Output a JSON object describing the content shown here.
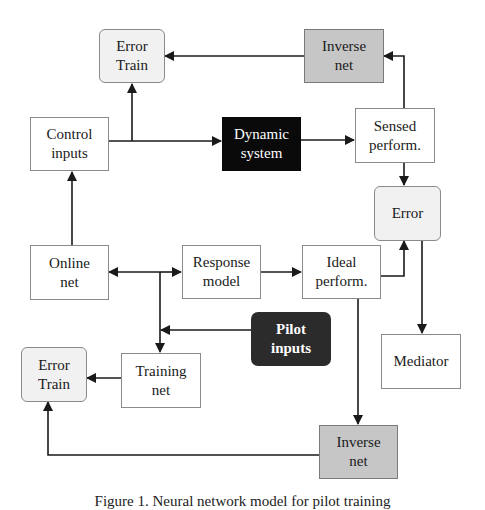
{
  "diagram": {
    "colors": {
      "plain_fill": "#ffffff",
      "rounded_fill": "#f1f1f1",
      "inverse_fill": "#c6c6c6",
      "dynamic_fill": "#0a0a0a",
      "pilot_fill": "#2b2b2b",
      "line": "#1a1a1a"
    },
    "nodes": {
      "error_train_top": {
        "label": "Error\nTrain",
        "style": "rounded"
      },
      "inverse_net_top": {
        "label": "Inverse\nnet",
        "style": "gray"
      },
      "control_inputs": {
        "label": "Control\ninputs",
        "style": "plain"
      },
      "dynamic_system": {
        "label": "Dynamic\nsystem",
        "style": "black"
      },
      "sensed_perform": {
        "label": "Sensed\nperform.",
        "style": "plain"
      },
      "error_right": {
        "label": "Error",
        "style": "rounded"
      },
      "online_net": {
        "label": "Online\nnet",
        "style": "plain"
      },
      "response_model": {
        "label": "Response\nmodel",
        "style": "plain"
      },
      "ideal_perform": {
        "label": "Ideal\nperform.",
        "style": "plain"
      },
      "pilot_inputs": {
        "label": "Pilot\ninputs",
        "style": "dark"
      },
      "mediator": {
        "label": "Mediator",
        "style": "plain"
      },
      "error_train_bottom": {
        "label": "Error\nTrain",
        "style": "rounded"
      },
      "training_net": {
        "label": "Training\nnet",
        "style": "plain"
      },
      "inverse_net_bottom": {
        "label": "Inverse\nnet",
        "style": "gray"
      }
    },
    "edges": [
      {
        "from": "online_net",
        "to": "control_inputs"
      },
      {
        "from": "control_inputs",
        "to": "dynamic_system"
      },
      {
        "from": "control_inputs",
        "to": "error_train_top"
      },
      {
        "from": "dynamic_system",
        "to": "sensed_perform"
      },
      {
        "from": "sensed_perform",
        "to": "inverse_net_top"
      },
      {
        "from": "inverse_net_top",
        "to": "error_train_top"
      },
      {
        "from": "sensed_perform",
        "to": "error_right"
      },
      {
        "from": "ideal_perform",
        "to": "error_right"
      },
      {
        "from": "error_right",
        "to": "mediator"
      },
      {
        "from": "junction",
        "to": "online_net"
      },
      {
        "from": "junction",
        "to": "response_model"
      },
      {
        "from": "junction",
        "to": "training_net"
      },
      {
        "from": "response_model",
        "to": "ideal_perform"
      },
      {
        "from": "pilot_inputs",
        "to": "training_net"
      },
      {
        "from": "training_net",
        "to": "error_train_bottom"
      },
      {
        "from": "ideal_perform",
        "to": "inverse_net_bottom"
      },
      {
        "from": "inverse_net_bottom",
        "to": "error_train_bottom"
      }
    ]
  },
  "caption": "Figure 1. Neural network model for pilot training"
}
